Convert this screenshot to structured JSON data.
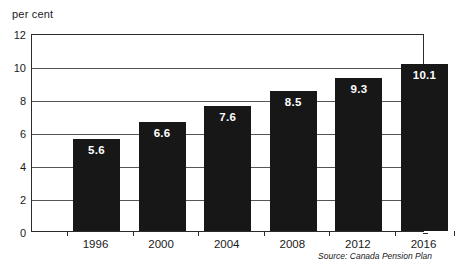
{
  "chart_data": {
    "type": "bar",
    "title": "",
    "subtitle": "",
    "xlabel": "",
    "ylabel": "per cent",
    "ylim": [
      0,
      12
    ],
    "yticks": [
      0,
      2,
      4,
      6,
      8,
      10,
      12
    ],
    "ytick_labels": [
      "0",
      "2",
      "4",
      "6",
      "8",
      "10",
      "12"
    ],
    "grid": true,
    "legend": false,
    "categories": [
      "1996",
      "2000",
      "2004",
      "2008",
      "2012",
      "2016"
    ],
    "values": [
      5.6,
      6.6,
      7.6,
      8.5,
      9.3,
      10.1
    ],
    "value_labels": [
      "5.6",
      "6.6",
      "7.6",
      "8.5",
      "9.3",
      "10.1"
    ],
    "bar_color": "#171717",
    "value_label_color": "#ffffff",
    "source": "Source: Canada Pension Plan"
  },
  "axis": {
    "unit_caption": "per cent"
  },
  "footer": {
    "source_text": "Source: Canada Pension Plan"
  }
}
